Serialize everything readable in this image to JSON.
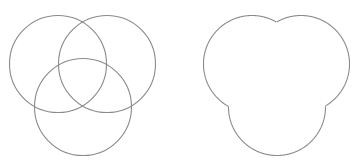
{
  "diagram": {
    "title": "",
    "stroke_color": "#8a8a8a",
    "stroke_width": 1.1,
    "background": "#ffffff",
    "panels": [
      {
        "name": "overlapping-circles",
        "type": "venn-three-circles",
        "circles": [
          {
            "cx": 58,
            "cy": 64,
            "r": 48.5
          },
          {
            "cx": 107,
            "cy": 64,
            "r": 48.5
          },
          {
            "cx": 83,
            "cy": 107,
            "r": 48.5
          }
        ]
      },
      {
        "name": "union-outline",
        "type": "union-of-three-circles",
        "offset_x": 194,
        "circles": [
          {
            "cx": 58,
            "cy": 64,
            "r": 48.5
          },
          {
            "cx": 107,
            "cy": 64,
            "r": 48.5
          },
          {
            "cx": 83,
            "cy": 107,
            "r": 48.5
          }
        ]
      }
    ]
  }
}
